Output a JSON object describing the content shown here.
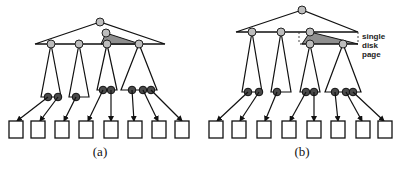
{
  "figure": {
    "panels": [
      {
        "id": "a",
        "caption": "(a)"
      },
      {
        "id": "b",
        "caption": "(b)",
        "annotation": [
          "single",
          "disk",
          "page"
        ]
      }
    ]
  }
}
